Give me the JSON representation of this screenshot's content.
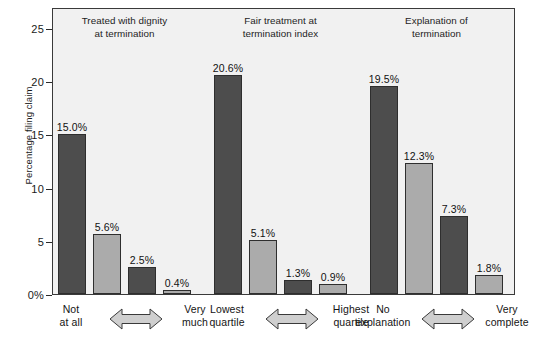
{
  "chart_data": {
    "type": "bar",
    "title": "",
    "xlabel": "",
    "ylabel": "Percentage filing claim",
    "ylim": [
      0,
      26.5
    ],
    "ytick_labels": [
      "0%",
      "5",
      "10",
      "15",
      "20",
      "25"
    ],
    "ytick_values": [
      0,
      5,
      10,
      15,
      20,
      25
    ],
    "grid": false,
    "legend": "none",
    "groups": [
      {
        "title_line1": "Treated with dignity",
        "title_line2": "at termination",
        "left_label_line1": "Not",
        "left_label_line2": "at all",
        "right_label_line1": "Very",
        "right_label_line2": "much",
        "categories": [
          "Not at all",
          "",
          "",
          "Very much"
        ],
        "values": [
          15.0,
          5.6,
          2.5,
          0.4
        ],
        "value_labels": [
          "15.0%",
          "5.6%",
          "2.5%",
          "0.4%"
        ],
        "shades": [
          "dark",
          "light",
          "dark",
          "light"
        ]
      },
      {
        "title_line1": "Fair treatment at",
        "title_line2": "termination index",
        "left_label_line1": "Lowest",
        "left_label_line2": "quartile",
        "right_label_line1": "Highest",
        "right_label_line2": "quartile",
        "categories": [
          "Lowest quartile",
          "",
          "",
          "Highest quartile"
        ],
        "values": [
          20.6,
          5.1,
          1.3,
          0.9
        ],
        "value_labels": [
          "20.6%",
          "5.1%",
          "1.3%",
          "0.9%"
        ],
        "shades": [
          "dark",
          "light",
          "dark",
          "light"
        ]
      },
      {
        "title_line1": "Explanation of",
        "title_line2": "termination",
        "left_label_line1": "No",
        "left_label_line2": "explanation",
        "right_label_line1": "Very",
        "right_label_line2": "complete",
        "categories": [
          "No explanation",
          "",
          "",
          "Very complete"
        ],
        "values": [
          19.5,
          12.3,
          7.3,
          1.8
        ],
        "value_labels": [
          "19.5%",
          "12.3%",
          "7.3%",
          "1.8%"
        ],
        "shades": [
          "dark",
          "light",
          "dark",
          "light"
        ]
      }
    ],
    "colors": {
      "dark_bar": "#4d4d4d",
      "light_bar": "#ababab",
      "plot_background": "#f1f1f1",
      "axis": "#3a3a3a",
      "text": "#1a1a1a"
    }
  }
}
